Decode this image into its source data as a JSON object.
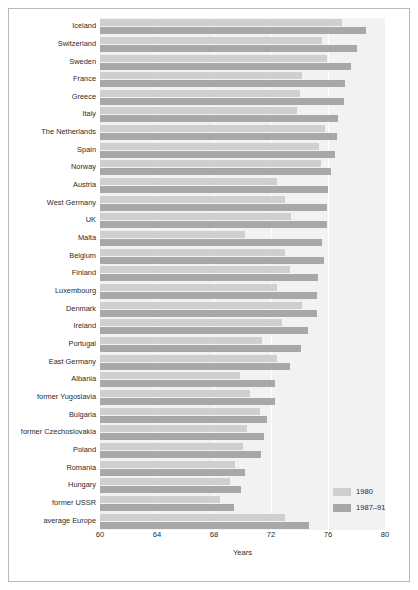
{
  "chart_data": {
    "type": "bar",
    "orientation": "horizontal",
    "title": "",
    "xlabel": "Years",
    "ylabel": "",
    "xlim": [
      60,
      80
    ],
    "xticks": [
      60,
      64,
      68,
      72,
      76,
      80
    ],
    "grid": true,
    "legend_position": "bottom-right",
    "colors": {
      "plot_background": "#f2f2f2",
      "series_1980": "#cfcfcf",
      "series_1987_91": "#a8a8a8",
      "gridline": "#ffffff",
      "frame": "#b9b9b9",
      "text": "#2b2b2b"
    },
    "categories": [
      "Iceland",
      "Switzerland",
      "Sweden",
      "France",
      "Greece",
      "Italy",
      "The Netherlands",
      "Spain",
      "Norway",
      "Austria",
      "West Germany",
      "UK",
      "Malta",
      "Belgium",
      "Finland",
      "Luxembourg",
      "Denmark",
      "Ireland",
      "Portugal",
      "East Germany",
      "Albania",
      "former Yugoslavia",
      "Bulgaria",
      "former Czechoslovakia",
      "Poland",
      "Romania",
      "Hungary",
      "former USSR",
      "average Europe"
    ],
    "series": [
      {
        "name": "1980",
        "values": [
          77.0,
          75.6,
          75.9,
          74.2,
          74.0,
          73.8,
          75.8,
          75.4,
          75.5,
          72.4,
          73.0,
          73.4,
          70.2,
          73.0,
          73.3,
          72.4,
          74.2,
          72.8,
          71.4,
          72.4,
          69.8,
          70.5,
          71.2,
          70.3,
          70.0,
          69.5,
          69.1,
          68.4,
          73.0
        ]
      },
      {
        "name": "1987–91",
        "values": [
          78.7,
          78.0,
          77.6,
          77.2,
          77.1,
          76.7,
          76.6,
          76.5,
          76.2,
          76.0,
          75.9,
          75.9,
          75.6,
          75.7,
          75.3,
          75.2,
          75.2,
          74.6,
          74.1,
          73.3,
          72.3,
          72.3,
          71.7,
          71.5,
          71.3,
          70.2,
          69.9,
          69.4,
          74.7
        ]
      }
    ],
    "legend": [
      {
        "label": "1980",
        "color": "#cfcfcf"
      },
      {
        "label": "1987–91",
        "color": "#a8a8a8"
      }
    ]
  }
}
